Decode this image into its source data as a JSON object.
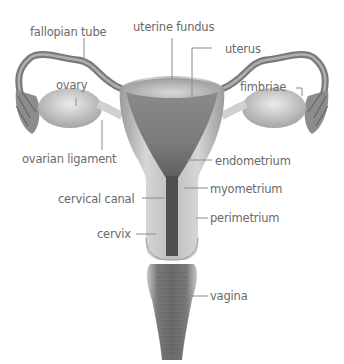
{
  "diagram": {
    "labels": {
      "fallopian_tube": "fallopian tube",
      "uterine_fundus": "uterine fundus",
      "uterus": "uterus",
      "ovary": "ovary",
      "fimbriae": "fimbriae",
      "ovarian_ligament": "ovarian ligament",
      "endometrium": "endometrium",
      "myometrium": "myometrium",
      "cervical_canal": "cervical canal",
      "perimetrium": "perimetrium",
      "cervix": "cervix",
      "vagina": "vagina"
    },
    "colors": {
      "label_text": "#6a6a6a",
      "leader_line": "#8a8a8a",
      "tissue_light": "#d4d4d4",
      "tissue_mid": "#a8a8a8",
      "tissue_dark": "#6e6e6e",
      "background": "#ffffff"
    }
  }
}
